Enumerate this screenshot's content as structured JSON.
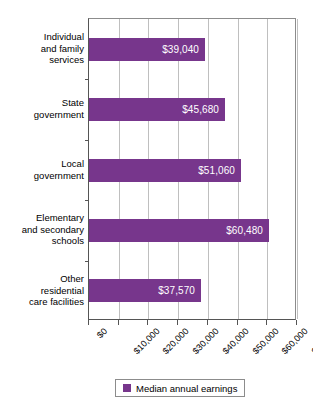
{
  "chart_data": {
    "type": "bar",
    "orientation": "horizontal",
    "title": "",
    "xlabel": "",
    "ylabel": "",
    "categories": [
      "Individual and family services",
      "State government",
      "Local government",
      "Elementary and secondary schools",
      "Other residential care facilities"
    ],
    "category_label_lines": [
      [
        "Individual",
        "and family",
        "services"
      ],
      [
        "State",
        "government"
      ],
      [
        "Local",
        "government"
      ],
      [
        "Elementary",
        "and secondary",
        "schools"
      ],
      [
        "Other",
        "residential",
        "care facilities"
      ]
    ],
    "values": [
      39040,
      45680,
      51060,
      60480,
      37570
    ],
    "value_labels": [
      "$39,040",
      "$45,680",
      "$51,060",
      "$60,480",
      "$37,570"
    ],
    "series": [
      {
        "name": "Median annual earnings",
        "values": [
          39040,
          45680,
          51060,
          60480,
          37570
        ],
        "color": "#77368c"
      }
    ],
    "xlim": [
      0,
      70000
    ],
    "xticks": [
      0,
      10000,
      20000,
      30000,
      40000,
      50000,
      60000,
      70000
    ],
    "xtick_labels": [
      "$0",
      "$10,000",
      "$20,000",
      "$30,000",
      "$40,000",
      "$50,000",
      "$60,000",
      "$70,000"
    ],
    "grid": "vertical",
    "legend_position": "bottom"
  },
  "legend": {
    "label": "Median annual earnings",
    "swatch_color": "#77368c"
  },
  "colors": {
    "bar": "#77368c",
    "gridline": "#bfbfbf",
    "axis": "#555555",
    "value_text": "#ffffff",
    "background": "#ffffff"
  }
}
